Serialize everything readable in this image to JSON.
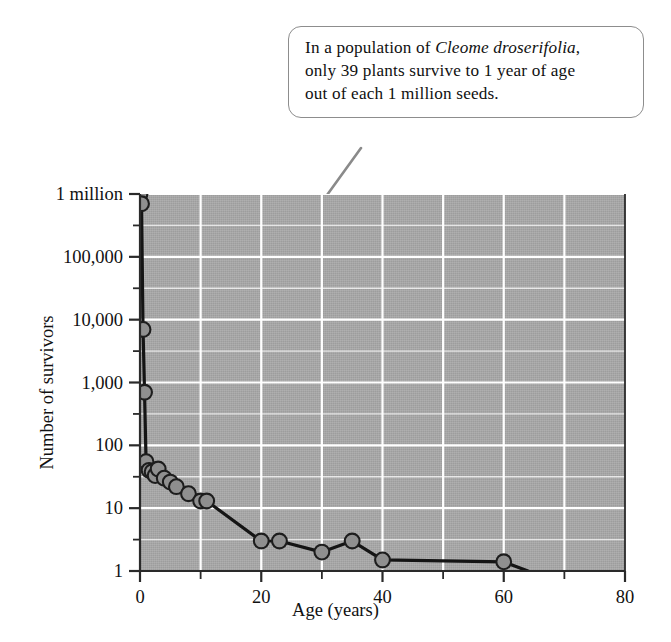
{
  "callout": {
    "line1_pre": "In a population of ",
    "species": "Cleome droserifolia",
    "line1_post": ",",
    "line2": "only 39 plants survive to 1 year of age",
    "line3": "out of each 1 million seeds."
  },
  "chart_data": {
    "type": "line",
    "title": "",
    "xlabel": "Age (years)",
    "ylabel": "Number of survivors",
    "xlim": [
      0,
      80
    ],
    "ylim": [
      1,
      1000000
    ],
    "yscale": "log",
    "grid": true,
    "legend": "none",
    "xticks": [
      0,
      20,
      40,
      60,
      80
    ],
    "xtick_labels": [
      "0",
      "20",
      "40",
      "60",
      "80"
    ],
    "xminor_ticks": [
      10,
      30,
      50,
      70
    ],
    "yticks": [
      1,
      10,
      100,
      1000,
      10000,
      100000,
      1000000
    ],
    "ytick_labels": [
      "1",
      "10",
      "100",
      "1,000",
      "10,000",
      "100,000",
      "1 million"
    ],
    "yminor_ticks": [
      3.16,
      31.6,
      316,
      3160,
      31600,
      316000
    ],
    "series": [
      {
        "name": "survivors",
        "x": [
          0,
          0.25,
          0.5,
          0.75,
          1,
          1.5,
          2,
          2.5,
          3,
          4,
          5,
          6,
          8,
          10,
          11,
          20,
          23,
          30,
          35,
          40,
          60,
          64
        ],
        "y": [
          1000000,
          700000,
          7000,
          700,
          55,
          40,
          38,
          33,
          42,
          30,
          26,
          22,
          17,
          13,
          13,
          3,
          3,
          2,
          3,
          1.5,
          1.4,
          1
        ]
      }
    ],
    "markers": {
      "x": [
        0,
        0.25,
        0.5,
        0.75,
        1,
        1.5,
        2,
        2.5,
        3,
        4,
        5,
        6,
        8,
        10,
        11,
        20,
        23,
        30,
        35,
        40,
        60
      ],
      "y": [
        1000000,
        700000,
        7000,
        700,
        55,
        40,
        38,
        33,
        42,
        30,
        26,
        22,
        17,
        13,
        13,
        3,
        3,
        2,
        3,
        1.5,
        1.4
      ]
    },
    "annotation_target": {
      "x": 1,
      "y": 39
    },
    "colors": {
      "panel": "#a9a9a9",
      "grid": "#ffffff",
      "line": "#141414",
      "marker_fill": "#8f8f8f",
      "marker_edge": "#1d1d1d",
      "leader": "#8a8a8a",
      "callout_border": "#8d8d8d"
    }
  }
}
